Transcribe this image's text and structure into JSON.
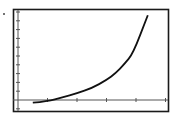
{
  "chart_data": {
    "type": "line",
    "title": "",
    "xlabel": "",
    "ylabel": "",
    "grid": false,
    "legend": null,
    "x_ticks_count": 5,
    "y_ticks_above_axis": 10,
    "y_ticks_below_axis": 1,
    "xlim": [
      -0.5,
      5
    ],
    "ylim": [
      -0.4,
      3.4
    ],
    "series": [
      {
        "name": "curve",
        "x": [
          0.5,
          1.0,
          1.5,
          2.0,
          2.5,
          3.0,
          3.3,
          3.6,
          3.9,
          4.4
        ],
        "y": [
          -0.1,
          -0.05,
          0.1,
          0.25,
          0.45,
          0.75,
          1.0,
          1.35,
          1.75,
          3.2
        ]
      }
    ]
  },
  "colors": {
    "frame": "#1a1a1a",
    "axes": "#555555",
    "curve": "#111111",
    "background": "#ffffff"
  }
}
